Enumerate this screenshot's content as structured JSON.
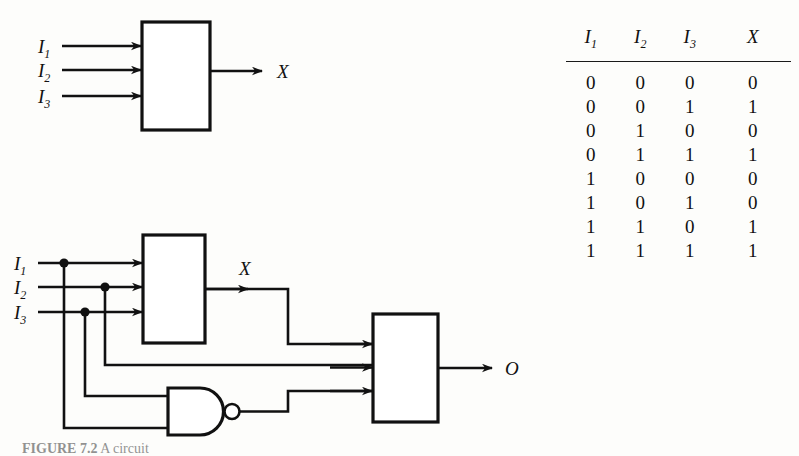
{
  "figure": {
    "caption_label": "FIGURE 7.2",
    "caption_text": "  A circuit"
  },
  "top_diagram": {
    "name": "single-block-diagram",
    "block_label": "",
    "inputs": [
      {
        "name": "I1",
        "base": "I",
        "sub": "1"
      },
      {
        "name": "I2",
        "base": "I",
        "sub": "2"
      },
      {
        "name": "I3",
        "base": "I",
        "sub": "3"
      }
    ],
    "output": {
      "name": "X",
      "label": "X"
    }
  },
  "bottom_diagram": {
    "name": "composite-circuit-diagram",
    "inputs": [
      {
        "name": "I1",
        "base": "I",
        "sub": "1"
      },
      {
        "name": "I2",
        "base": "I",
        "sub": "2"
      },
      {
        "name": "I3",
        "base": "I",
        "sub": "3"
      }
    ],
    "intermediate_output": {
      "name": "X",
      "label": "X"
    },
    "final_output": {
      "name": "O",
      "label": "O"
    },
    "gates": [
      {
        "name": "block-1",
        "type": "block"
      },
      {
        "name": "nand-gate",
        "type": "nand"
      },
      {
        "name": "block-2",
        "type": "block"
      }
    ]
  },
  "truth_table": {
    "headers": [
      {
        "base": "I",
        "sub": "1"
      },
      {
        "base": "I",
        "sub": "2"
      },
      {
        "base": "I",
        "sub": "3"
      },
      {
        "base": "X",
        "sub": ""
      }
    ],
    "rows": [
      [
        "0",
        "0",
        "0",
        "0"
      ],
      [
        "0",
        "0",
        "1",
        "1"
      ],
      [
        "0",
        "1",
        "0",
        "0"
      ],
      [
        "0",
        "1",
        "1",
        "1"
      ],
      [
        "1",
        "0",
        "0",
        "0"
      ],
      [
        "1",
        "0",
        "1",
        "0"
      ],
      [
        "1",
        "1",
        "0",
        "1"
      ],
      [
        "1",
        "1",
        "1",
        "1"
      ]
    ]
  },
  "colors": {
    "ink": "#111111",
    "paper": "#fdfdfb"
  }
}
